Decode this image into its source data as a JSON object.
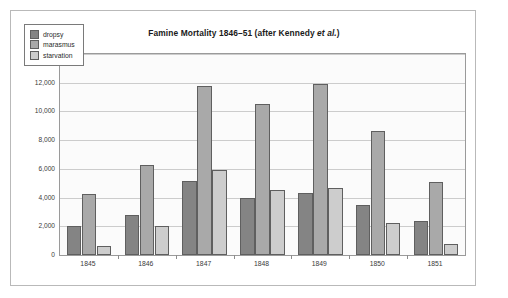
{
  "figure": {
    "title_plain": "Famine Mortality 1846–51 (after Kennedy et al.)",
    "title_main": "Famine Mortality 1846–51 (after Kennedy ",
    "title_italic": "et al.",
    "title_tail": ")"
  },
  "legend": {
    "position": "inside-top-left",
    "items": [
      {
        "label": "dropsy",
        "color": "#848484"
      },
      {
        "label": "marasmus",
        "color": "#a9a9a9"
      },
      {
        "label": "starvation",
        "color": "#cdcdcd"
      }
    ]
  },
  "axes": {
    "ytick_labels": [
      "14,000",
      "12,000",
      "10,000",
      "8,000",
      "6,000",
      "4,000",
      "2,000",
      "0"
    ],
    "ytick_values": [
      14000,
      12000,
      10000,
      8000,
      6000,
      4000,
      2000,
      0
    ],
    "xtick_labels": [
      "1845",
      "1846",
      "1847",
      "1848",
      "1849",
      "1850",
      "1851"
    ]
  },
  "colors": {
    "plot_background": "#fbfbfb",
    "gridline": "#cccccc",
    "plot_border": "#9a9a9a",
    "figure_border": "#b9b9b9",
    "bar_outline": "#5f5f5f",
    "title_text": "#1a1a1a",
    "tick_text": "#3a3a3a"
  },
  "chart_data": {
    "type": "bar",
    "title": "Famine Mortality 1846–51 (after Kennedy et al.)",
    "xlabel": "",
    "ylabel": "",
    "ylim": [
      0,
      14000
    ],
    "ytick_step": 2000,
    "grid": true,
    "legend_position": "upper left (inside plot)",
    "categories": [
      "1845",
      "1846",
      "1847",
      "1848",
      "1849",
      "1850",
      "1851"
    ],
    "series": [
      {
        "name": "dropsy",
        "color": "#848484",
        "values": [
          2050,
          2800,
          5150,
          3950,
          4300,
          3500,
          2400
        ]
      },
      {
        "name": "marasmus",
        "color": "#a9a9a9",
        "values": [
          4250,
          6300,
          11750,
          10550,
          11900,
          8650,
          5100
        ]
      },
      {
        "name": "starvation",
        "color": "#cdcdcd",
        "values": [
          650,
          2050,
          5950,
          4500,
          4700,
          2250,
          800
        ]
      }
    ]
  }
}
